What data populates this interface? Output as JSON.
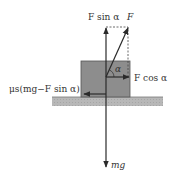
{
  "diagram": {
    "labels": {
      "f_sin": "F sin α",
      "f": "F",
      "alpha": "α",
      "f_cos": "F cos α",
      "friction": "μs(mg−F sin α)",
      "weight": "mg"
    },
    "colors": {
      "block": "#8a8a8a",
      "block_border": "#555555",
      "ground": "#b4b4b4",
      "arrow": "#2a2a2a",
      "text": "#333333"
    }
  }
}
